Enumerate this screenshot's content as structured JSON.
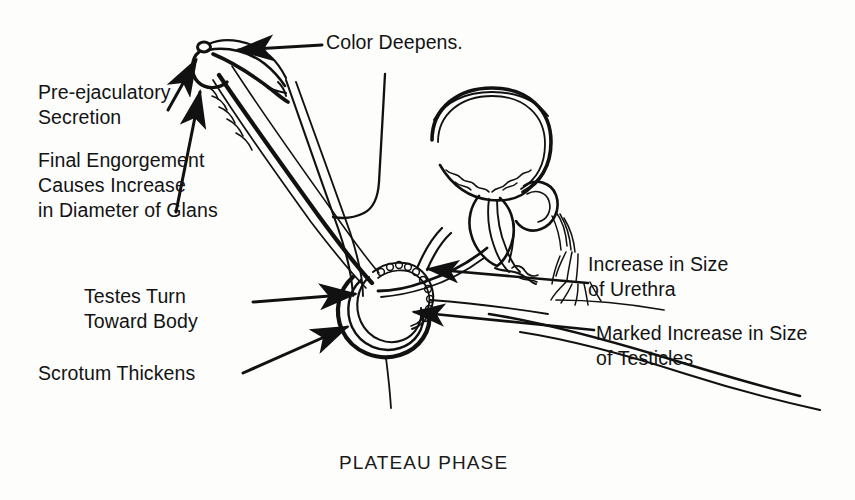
{
  "figure": {
    "title": "PLATEAU PHASE",
    "style": "black-and-white-line-drawing",
    "background_color": "#fdfdfc",
    "ink_color": "#111111",
    "text_color": "#131313"
  },
  "labels": {
    "color_deepens": "Color Deepens.",
    "pre_ejaculatory": "Pre-ejaculatory\nSecretion",
    "final_engorgement": "Final Engorgement\nCauses Increase\nin Diameter of Glans",
    "testes_turn": "Testes Turn\nToward Body",
    "scrotum_thickens": "Scrotum Thickens",
    "urethra_increase": "Increase in Size\nof Urethra",
    "testicles_increase": "Marked Increase in Size\nof Testicles"
  },
  "caption": {
    "text": "PLATEAU PHASE"
  }
}
